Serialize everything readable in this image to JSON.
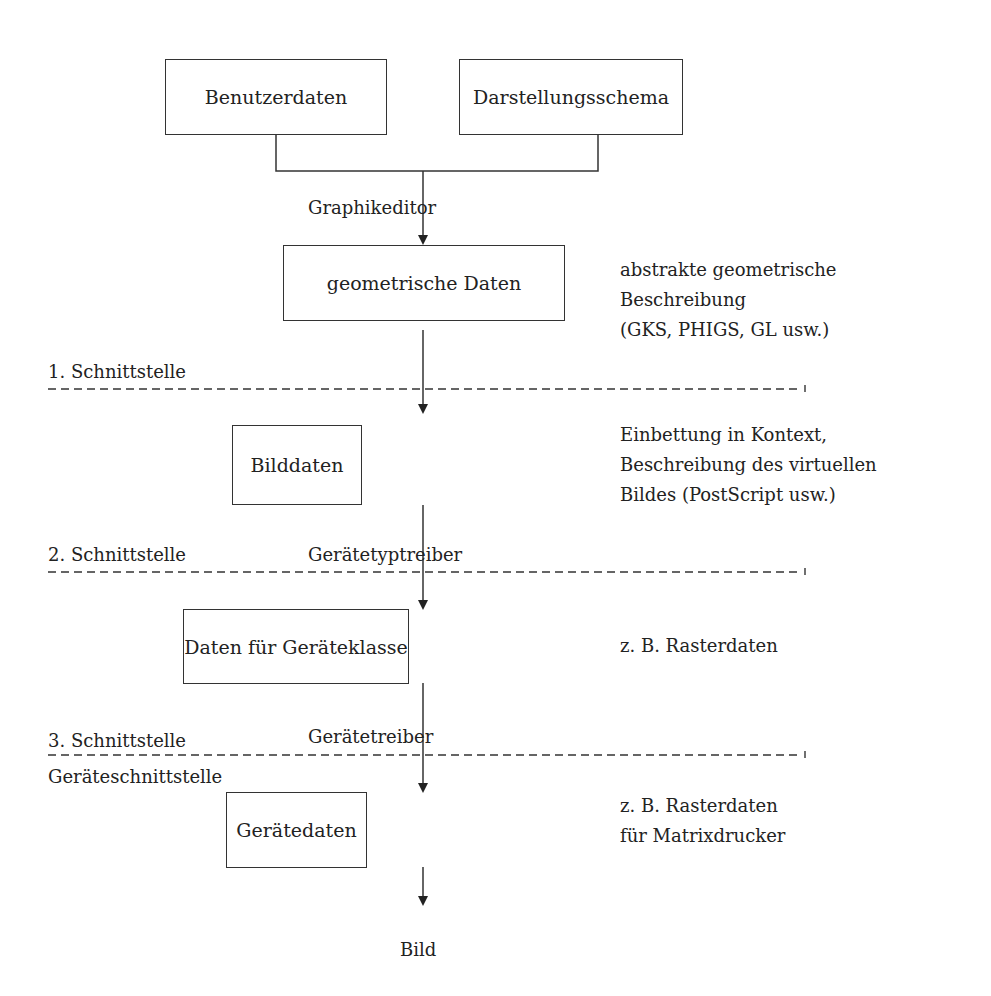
{
  "boxes": {
    "user_data": "Benutzerdaten",
    "presentation_schema": "Darstellungsschema",
    "geometric_data": "geometrische Daten",
    "image_data": "Bilddaten",
    "device_class_data": "Daten für Geräteklasse",
    "device_data": "Gerätedaten"
  },
  "edges": {
    "graphics_editor": "Graphikeditor",
    "device_type_driver": "Gerätetyptreiber",
    "device_driver": "Gerätetreiber"
  },
  "interfaces": {
    "first": "1. Schnittstelle",
    "second": "2. Schnittstelle",
    "third": "3. Schnittstelle",
    "device_interface": "Geräteschnittstelle"
  },
  "notes": {
    "geometric": [
      "abstrakte geometrische",
      "Beschreibung",
      "(GKS, PHIGS, GL usw.)"
    ],
    "image": [
      "Einbettung in Kontext,",
      "Beschreibung des virtuellen",
      "Bildes (PostScript usw.)"
    ],
    "device_class": [
      "z. B. Rasterdaten"
    ],
    "device": [
      "z. B. Rasterdaten",
      "für Matrixdrucker"
    ]
  },
  "output": "Bild"
}
